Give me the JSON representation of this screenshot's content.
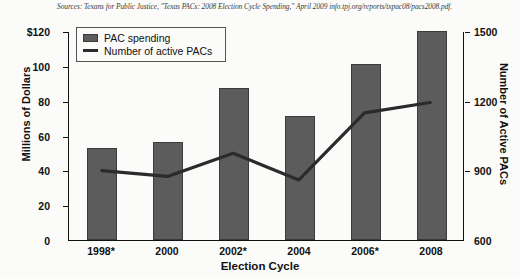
{
  "source_note": "Sources: Texans for Public Justice, \"Texas PACs: 2008 Election Cycle Spending,\" April 2009 info.tpj.org/reports/txpac08/pacs2008.pdf.",
  "axis_titles": {
    "left": "Millions of Dollars",
    "right": "Number of Active PACs",
    "bottom": "Election Cycle"
  },
  "legend": {
    "bar_label": "PAC spending",
    "line_label": "Number of active PACs"
  },
  "colors": {
    "bar_fill": "#5c5c5c",
    "bar_stroke": "#3b3b3b",
    "line": "#2b2b2b",
    "axis": "#111111",
    "background": "#fbfbf9"
  },
  "chart_data": {
    "type": "bar",
    "title": "",
    "subtitle": "",
    "xlabel": "Election Cycle",
    "ylabel": "Millions of Dollars",
    "y2label": "Number of Active PACs",
    "categories": [
      "1998*",
      "2000",
      "2002*",
      "2004",
      "2006*",
      "2008"
    ],
    "grid": false,
    "legend_position": "top-left",
    "ylim": [
      0,
      120
    ],
    "yticks": [
      0,
      20,
      40,
      60,
      80,
      100,
      120
    ],
    "ytick_labels": [
      "0",
      "20",
      "40",
      "60",
      "80",
      "100",
      "$120"
    ],
    "y2lim": [
      600,
      1500
    ],
    "y2ticks": [
      600,
      900,
      1200,
      1500
    ],
    "y2tick_labels": [
      "600",
      "900",
      "1200",
      "1500"
    ],
    "series": [
      {
        "name": "PAC spending",
        "type": "bar",
        "axis": "left",
        "unit": "millions of dollars",
        "values": [
          53,
          56,
          87,
          71,
          101,
          120
        ]
      },
      {
        "name": "Number of active PACs",
        "type": "line",
        "axis": "right",
        "unit": "active PACs",
        "values": [
          900,
          875,
          975,
          860,
          1150,
          1195
        ]
      }
    ]
  }
}
